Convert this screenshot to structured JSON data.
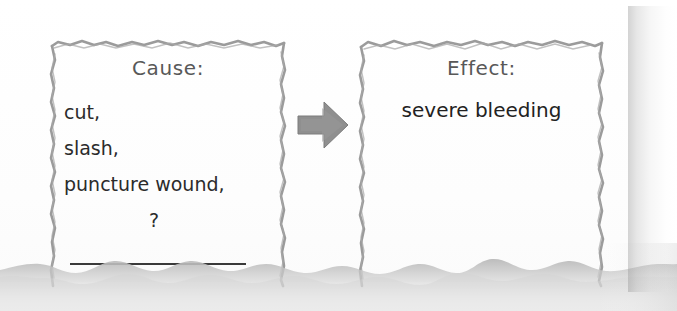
{
  "page": {
    "background_color": "#ffffff",
    "paper_color": "#fdfdfd"
  },
  "diagram": {
    "type": "cause-and-effect",
    "arrow": {
      "icon": "right-block-arrow-icon",
      "direction": "right",
      "color": "#8c8c8c"
    },
    "cause_box": {
      "heading": "Cause:",
      "items": [
        "cut,",
        "slash,",
        "puncture wound,",
        "?"
      ],
      "blank_line": true,
      "border_color": "#8a8a8a",
      "text_color": "#2b2b2b"
    },
    "effect_box": {
      "heading": "Effect:",
      "items": [
        "severe bleeding"
      ],
      "border_color": "#8a8a8a",
      "text_color": "#222222"
    }
  }
}
